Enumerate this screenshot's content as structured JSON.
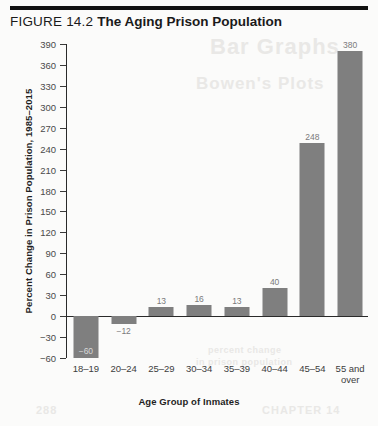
{
  "header": {
    "figure_number": "FIGURE 14.2",
    "figure_title": "The Aging Prison Population"
  },
  "bleed_text": {
    "line1": "Bar Graphs",
    "line2": "Bowen's Plots",
    "line3": "percent change",
    "line4": "in prison population",
    "line5": "288",
    "line6": "CHAPTER 14"
  },
  "chart_data": {
    "type": "bar",
    "title": "The Aging Prison Population",
    "xlabel": "Age Group of Inmates",
    "ylabel": "Percent Change in Prison Population, 1985–2015",
    "categories": [
      "18–19",
      "20–24",
      "25–29",
      "30–34",
      "35–39",
      "40–44",
      "45–54",
      "55 and\nover"
    ],
    "values": [
      -60,
      -12,
      13,
      16,
      13,
      40,
      248,
      380
    ],
    "value_labels": [
      "−60",
      "−12",
      "13",
      "16",
      "13",
      "40",
      "248",
      "380"
    ],
    "ylim": [
      -60,
      390
    ],
    "ytick_step": 30,
    "yticks": [
      390,
      360,
      330,
      300,
      270,
      240,
      210,
      180,
      150,
      120,
      90,
      60,
      30,
      0,
      -30,
      -60
    ],
    "ytick_labels": [
      "390",
      "360",
      "330",
      "300",
      "270",
      "240",
      "210",
      "180",
      "150",
      "120",
      "90",
      "60",
      "30",
      "0",
      "−30",
      "−60"
    ],
    "grid": false,
    "legend": false,
    "bar_color": "#7f7f7f",
    "axis_color": "#2a2a2a",
    "background": "#fbfbfa"
  }
}
